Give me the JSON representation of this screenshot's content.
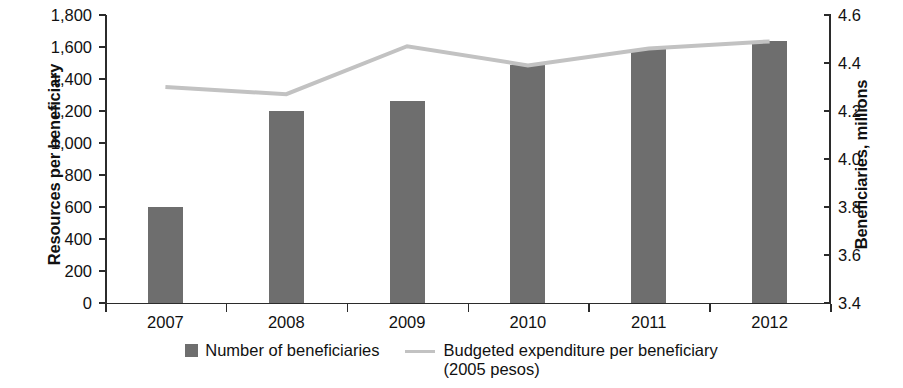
{
  "chart_data": {
    "type": "bar",
    "title": "",
    "subtitle": "",
    "xlabel": "",
    "categories": [
      "2007",
      "2008",
      "2009",
      "2010",
      "2011",
      "2012"
    ],
    "grid": false,
    "legend_position": "bottom",
    "series": [
      {
        "name": "Number of beneficiaries",
        "type": "bar",
        "axis": "left",
        "color": "#6e6e6e",
        "values": [
          600,
          1200,
          1260,
          1490,
          1590,
          1640
        ]
      },
      {
        "name": "Budgeted expenditure per beneficiary (2005 pesos)",
        "type": "line",
        "axis": "right",
        "color": "#c2c2c2",
        "values": [
          4.3,
          4.27,
          4.47,
          4.39,
          4.46,
          4.49
        ]
      }
    ],
    "left_axis": {
      "label": "Resources per beneficiary",
      "ylim": [
        0,
        1800
      ],
      "ticks": [
        0,
        200,
        400,
        600,
        800,
        1000,
        1200,
        1400,
        1600,
        1800
      ],
      "tick_labels": [
        "0",
        "200",
        "400",
        "600",
        "800",
        "1,000",
        "1,200",
        "1,400",
        "1,600",
        "1,800"
      ]
    },
    "right_axis": {
      "label": "Beneficiaries, millions",
      "ylim": [
        3.4,
        4.6
      ],
      "ticks": [
        3.4,
        3.6,
        3.8,
        4.0,
        4.2,
        4.4,
        4.6
      ],
      "tick_labels": [
        "3.4",
        "3.6",
        "3.8",
        "4.0",
        "4.2",
        "4.4",
        "4.6"
      ]
    }
  },
  "legend": {
    "bars": {
      "label": "Number of beneficiaries",
      "color": "#6e6e6e"
    },
    "line": {
      "label_line1": "Budgeted expenditure per beneficiary",
      "label_line2": "(2005 pesos)",
      "color": "#c2c2c2"
    }
  }
}
